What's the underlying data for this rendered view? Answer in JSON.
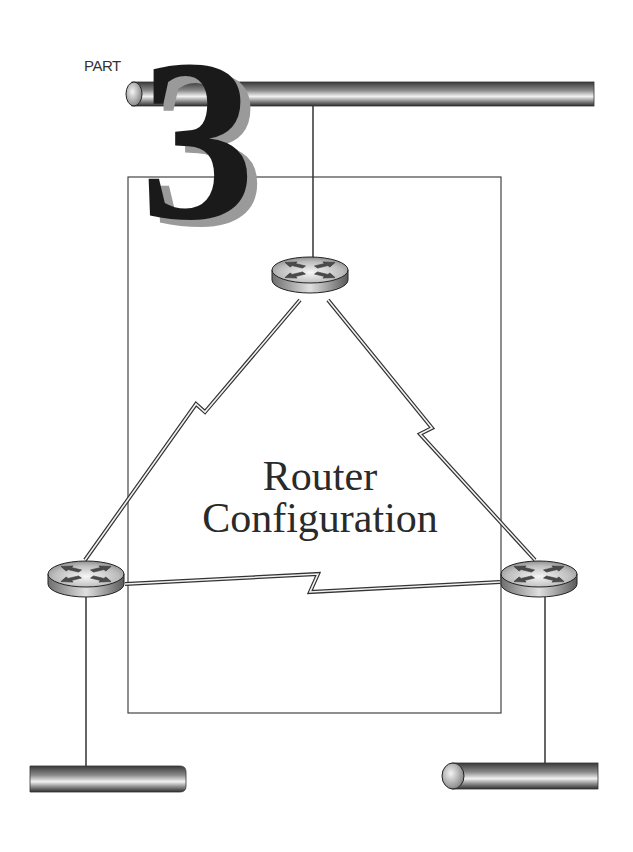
{
  "page": {
    "part_label": "PART",
    "part_number": "3",
    "title_line1": "Router",
    "title_line2": "Configuration"
  },
  "diagram": {
    "routers": [
      {
        "id": "router-top",
        "icon": "router-icon"
      },
      {
        "id": "router-left",
        "icon": "router-icon"
      },
      {
        "id": "router-right",
        "icon": "router-icon"
      }
    ],
    "links": [
      {
        "from": "router-top",
        "to": "router-left",
        "type": "serial-wan-link"
      },
      {
        "from": "router-top",
        "to": "router-right",
        "type": "serial-wan-link"
      },
      {
        "from": "router-left",
        "to": "router-right",
        "type": "serial-wan-link"
      }
    ],
    "segments": [
      {
        "id": "top-backbone",
        "type": "lan-segment"
      },
      {
        "id": "bottom-left-segment",
        "type": "lan-segment"
      },
      {
        "id": "bottom-right-segment",
        "type": "lan-segment"
      }
    ],
    "colors": {
      "line": "#333333",
      "numeral": "#1a1a1a",
      "numeral_shadow": "#9a9a9a"
    }
  }
}
